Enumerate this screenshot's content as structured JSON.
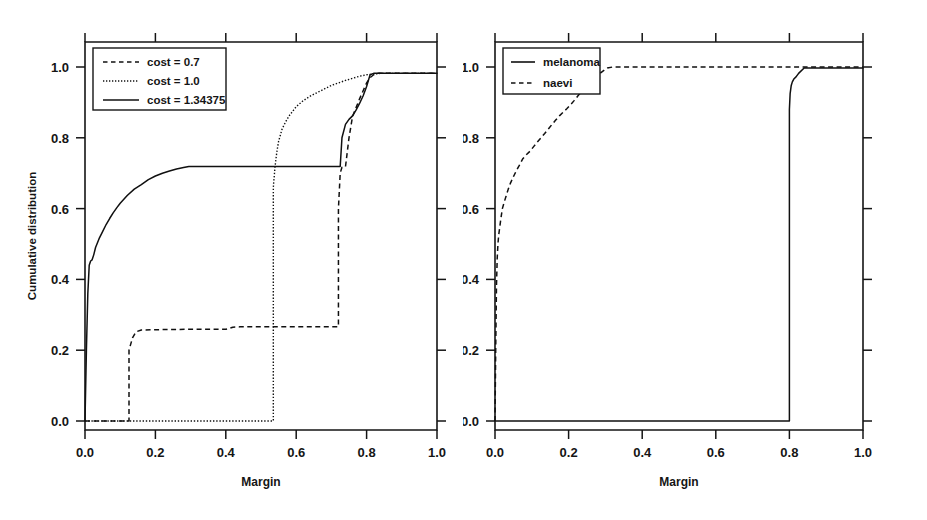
{
  "figure": {
    "background": "#ffffff",
    "ink_color": "#101010",
    "panel_count": 2
  },
  "chart_data": [
    {
      "type": "line",
      "panel": "left",
      "title": "",
      "xlabel": "Margin",
      "ylabel": "Cumulative distribution",
      "xlim": [
        0.0,
        1.0
      ],
      "ylim": [
        0.0,
        1.0
      ],
      "xticks": [
        "0.0",
        "0.2",
        "0.4",
        "0.6",
        "0.8",
        "1.0"
      ],
      "yticks": [
        "0.0",
        "0.2",
        "0.4",
        "0.6",
        "0.8",
        "1.0"
      ],
      "xtick_values": [
        0.0,
        0.2,
        0.4,
        0.6,
        0.8,
        1.0
      ],
      "ytick_values": [
        0.0,
        0.2,
        0.4,
        0.6,
        0.8,
        1.0
      ],
      "grid": false,
      "legend_position": "top-left",
      "series": [
        {
          "name": "cost = 0.7",
          "style": "dashed",
          "x": [
            0.0,
            0.125,
            0.125,
            0.135,
            0.145,
            0.16,
            0.2,
            0.3,
            0.4,
            0.42,
            0.44,
            0.55,
            0.6,
            0.7,
            0.715,
            0.72,
            0.72,
            0.725,
            0.73,
            0.74,
            0.75,
            0.76,
            0.78,
            0.8,
            0.81,
            0.82,
            0.83,
            0.86,
            0.9,
            1.0
          ],
          "y": [
            0.0,
            0.0,
            0.2,
            0.235,
            0.252,
            0.257,
            0.258,
            0.259,
            0.259,
            0.265,
            0.266,
            0.266,
            0.266,
            0.266,
            0.266,
            0.266,
            0.6,
            0.7,
            0.717,
            0.718,
            0.8,
            0.86,
            0.91,
            0.955,
            0.97,
            0.978,
            0.982,
            0.982,
            0.982,
            0.982
          ]
        },
        {
          "name": "cost = 1.0",
          "style": "dotted",
          "x": [
            0.0,
            0.53,
            0.535,
            0.535,
            0.54,
            0.545,
            0.55,
            0.56,
            0.57,
            0.58,
            0.59,
            0.6,
            0.62,
            0.64,
            0.66,
            0.68,
            0.7,
            0.72,
            0.74,
            0.76,
            0.78,
            0.8,
            0.82,
            0.84,
            0.88,
            0.92,
            0.96,
            1.0
          ],
          "y": [
            0.0,
            0.0,
            0.0,
            0.66,
            0.72,
            0.76,
            0.79,
            0.825,
            0.845,
            0.862,
            0.875,
            0.888,
            0.905,
            0.918,
            0.928,
            0.938,
            0.948,
            0.955,
            0.962,
            0.968,
            0.974,
            0.978,
            0.98,
            0.982,
            0.982,
            0.982,
            0.982,
            0.982
          ]
        },
        {
          "name": "cost = 1.34375",
          "style": "solid",
          "x": [
            0.0,
            0.004,
            0.008,
            0.012,
            0.016,
            0.02,
            0.025,
            0.03,
            0.04,
            0.05,
            0.06,
            0.07,
            0.08,
            0.09,
            0.1,
            0.12,
            0.14,
            0.16,
            0.18,
            0.2,
            0.22,
            0.24,
            0.26,
            0.28,
            0.295,
            0.3,
            0.35,
            0.4,
            0.5,
            0.6,
            0.7,
            0.715,
            0.72,
            0.725,
            0.73,
            0.74,
            0.75,
            0.76,
            0.77,
            0.78,
            0.79,
            0.8,
            0.805,
            0.81,
            0.82,
            0.85,
            0.9,
            0.95,
            1.0
          ],
          "y": [
            0.0,
            0.2,
            0.36,
            0.44,
            0.452,
            0.455,
            0.47,
            0.49,
            0.515,
            0.535,
            0.555,
            0.572,
            0.588,
            0.602,
            0.615,
            0.637,
            0.655,
            0.668,
            0.682,
            0.692,
            0.7,
            0.706,
            0.712,
            0.716,
            0.719,
            0.719,
            0.719,
            0.719,
            0.719,
            0.719,
            0.719,
            0.719,
            0.719,
            0.719,
            0.8,
            0.838,
            0.852,
            0.862,
            0.878,
            0.897,
            0.918,
            0.945,
            0.962,
            0.978,
            0.982,
            0.982,
            0.982,
            0.982,
            0.982
          ]
        }
      ],
      "legend": [
        {
          "label": "cost = 0.7",
          "style": "dashed"
        },
        {
          "label": "cost = 1.0",
          "style": "dotted"
        },
        {
          "label": "cost = 1.34375",
          "style": "solid"
        }
      ]
    },
    {
      "type": "line",
      "panel": "right",
      "title": "",
      "xlabel": "Margin",
      "ylabel": "Cumulative distribution",
      "xlim": [
        0.0,
        1.0
      ],
      "ylim": [
        0.0,
        1.0
      ],
      "xticks": [
        "0.0",
        "0.2",
        "0.4",
        "0.6",
        "0.8",
        "1.0"
      ],
      "yticks": [
        "0.0",
        "0.2",
        "0.4",
        "0.6",
        "0.8",
        "1.0"
      ],
      "xtick_values": [
        0.0,
        0.2,
        0.4,
        0.6,
        0.8,
        1.0
      ],
      "ytick_values": [
        0.0,
        0.2,
        0.4,
        0.6,
        0.8,
        1.0
      ],
      "grid": false,
      "legend_position": "top-left",
      "series": [
        {
          "name": "melanoma",
          "style": "solid",
          "x": [
            0.0,
            0.1,
            0.2,
            0.3,
            0.4,
            0.5,
            0.6,
            0.7,
            0.78,
            0.795,
            0.8,
            0.8,
            0.802,
            0.805,
            0.808,
            0.812,
            0.818,
            0.825,
            0.84,
            0.88,
            0.92,
            0.96,
            1.0
          ],
          "y": [
            0.0,
            0.0,
            0.0,
            0.0,
            0.0,
            0.0,
            0.0,
            0.0,
            0.0,
            0.0,
            0.0,
            0.88,
            0.925,
            0.948,
            0.958,
            0.966,
            0.972,
            0.982,
            0.997,
            0.997,
            0.997,
            0.997,
            0.997
          ]
        },
        {
          "name": "naevi",
          "style": "dashed",
          "x": [
            0.0,
            0.002,
            0.004,
            0.006,
            0.008,
            0.01,
            0.013,
            0.016,
            0.02,
            0.025,
            0.03,
            0.036,
            0.042,
            0.05,
            0.058,
            0.066,
            0.075,
            0.085,
            0.095,
            0.105,
            0.115,
            0.125,
            0.135,
            0.145,
            0.155,
            0.165,
            0.175,
            0.185,
            0.195,
            0.205,
            0.215,
            0.225,
            0.235,
            0.245,
            0.255,
            0.265,
            0.275,
            0.285,
            0.295,
            0.305,
            0.32,
            0.4,
            0.5,
            0.6,
            0.7,
            0.8,
            0.9,
            1.0
          ],
          "y": [
            0.0,
            0.21,
            0.38,
            0.46,
            0.5,
            0.525,
            0.548,
            0.572,
            0.6,
            0.618,
            0.635,
            0.655,
            0.672,
            0.69,
            0.707,
            0.722,
            0.74,
            0.752,
            0.762,
            0.775,
            0.788,
            0.8,
            0.812,
            0.825,
            0.838,
            0.85,
            0.862,
            0.872,
            0.882,
            0.893,
            0.905,
            0.918,
            0.93,
            0.942,
            0.952,
            0.962,
            0.972,
            0.982,
            0.99,
            0.997,
            1.0,
            1.0,
            1.0,
            1.0,
            1.0,
            1.0,
            1.0,
            1.0
          ]
        }
      ],
      "legend": [
        {
          "label": "melanoma",
          "style": "solid"
        },
        {
          "label": "naevi",
          "style": "dashed"
        }
      ]
    }
  ]
}
